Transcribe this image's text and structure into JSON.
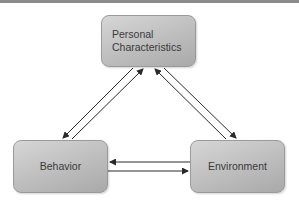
{
  "diagram": {
    "type": "reciprocal-triad",
    "nodes": [
      {
        "id": "personal",
        "label": "Personal\nCharacteristics"
      },
      {
        "id": "behavior",
        "label": "Behavior"
      },
      {
        "id": "environment",
        "label": "Environment"
      }
    ],
    "edges": [
      {
        "from": "personal",
        "to": "behavior"
      },
      {
        "from": "behavior",
        "to": "personal"
      },
      {
        "from": "personal",
        "to": "environment"
      },
      {
        "from": "environment",
        "to": "personal"
      },
      {
        "from": "environment",
        "to": "behavior"
      },
      {
        "from": "behavior",
        "to": "environment"
      }
    ],
    "colors": {
      "node_fill": "#c0c0c0",
      "node_border": "#9a9a9a",
      "arrow": "#2a2a2a",
      "text": "#3a3a3a"
    }
  }
}
